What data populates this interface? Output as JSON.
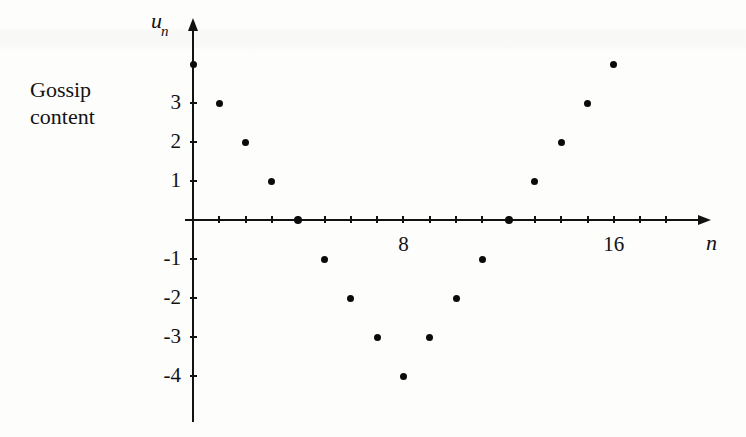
{
  "caption": {
    "line1": "Gossip",
    "line2": "content"
  },
  "axes": {
    "y_title_main": "u",
    "y_title_sub": "n",
    "x_title": "n",
    "y_tick_labels": [
      "3",
      "2",
      "1",
      "-1",
      "-2",
      "-3",
      "-4"
    ],
    "x_tick_labels": [
      "8",
      "16"
    ]
  },
  "chart_data": {
    "type": "scatter",
    "title": "",
    "subtitle": "",
    "xlabel": "n",
    "ylabel": "u_n",
    "annotations": [
      "Gossip content"
    ],
    "grid": false,
    "legend": null,
    "xlim": [
      0,
      17
    ],
    "ylim": [
      -4,
      4
    ],
    "x_ticks_labeled": [
      8,
      16
    ],
    "y_ticks_labeled": [
      3,
      2,
      1,
      -1,
      -2,
      -3,
      -4
    ],
    "x_tick_step": 1,
    "y_tick_step": 1,
    "series": [
      {
        "name": "u_n",
        "x": [
          0,
          1,
          2,
          3,
          4,
          5,
          6,
          7,
          8,
          9,
          10,
          11,
          12,
          13,
          14,
          15,
          16
        ],
        "values": [
          4,
          3,
          2,
          1,
          0,
          -1,
          -2,
          -3,
          -4,
          -3,
          -2,
          -1,
          0,
          1,
          2,
          3,
          4
        ]
      }
    ],
    "relation": "u_n = |n - 8| - 4"
  },
  "geometry": {
    "origin_x": 193,
    "origin_y": 220,
    "x_unit_px": 26.3,
    "y_unit_px": 39.0
  }
}
